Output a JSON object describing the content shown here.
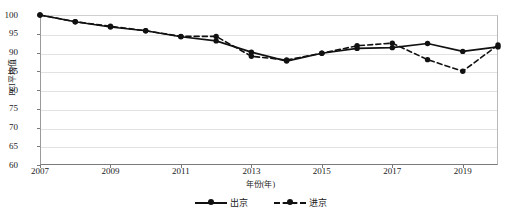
{
  "chart_data": {
    "type": "line",
    "title": "",
    "xlabel": "年份(年)",
    "ylabel": "PCI平均值",
    "x": [
      2007,
      2008,
      2009,
      2010,
      2011,
      2012,
      2013,
      2014,
      2015,
      2016,
      2017,
      2018,
      2019,
      2020
    ],
    "categories": [
      "2007",
      "2008",
      "2009",
      "2010",
      "2011",
      "2012",
      "2013",
      "2014",
      "2015",
      "2016",
      "2017",
      "2018",
      "2019",
      "2020"
    ],
    "series": [
      {
        "name": "出京",
        "style": "solid",
        "marker": "circle",
        "color": "#111111",
        "values": [
          100.0,
          98.2,
          96.8,
          95.8,
          94.2,
          93.1,
          90.1,
          87.7,
          89.8,
          91.1,
          91.3,
          92.4,
          90.3,
          91.5
        ]
      },
      {
        "name": "进京",
        "style": "dashed",
        "marker": "circle",
        "color": "#111111",
        "values": [
          100.0,
          98.2,
          97.0,
          95.8,
          94.3,
          94.3,
          89.0,
          88.0,
          89.8,
          91.8,
          92.5,
          88.1,
          85.0,
          92.0
        ]
      }
    ],
    "ylim": [
      60,
      100
    ],
    "xlim": [
      2007,
      2020
    ],
    "yticks": [
      60,
      65,
      70,
      75,
      80,
      85,
      90,
      95,
      100
    ],
    "ytick_labels": [
      "60",
      "65",
      "70",
      "75",
      "80",
      "85",
      "90",
      "95",
      "100"
    ],
    "xticks": [
      2007,
      2009,
      2011,
      2013,
      2015,
      2017,
      2019
    ],
    "xtick_labels": [
      "2007",
      "2009",
      "2011",
      "2013",
      "2015",
      "2017",
      "2019"
    ],
    "grid": true,
    "grid_axis": "y",
    "legend_position": "bottom"
  },
  "legend": {
    "items": [
      {
        "label": "出京",
        "style": "solid"
      },
      {
        "label": "进京",
        "style": "dashed"
      }
    ]
  }
}
